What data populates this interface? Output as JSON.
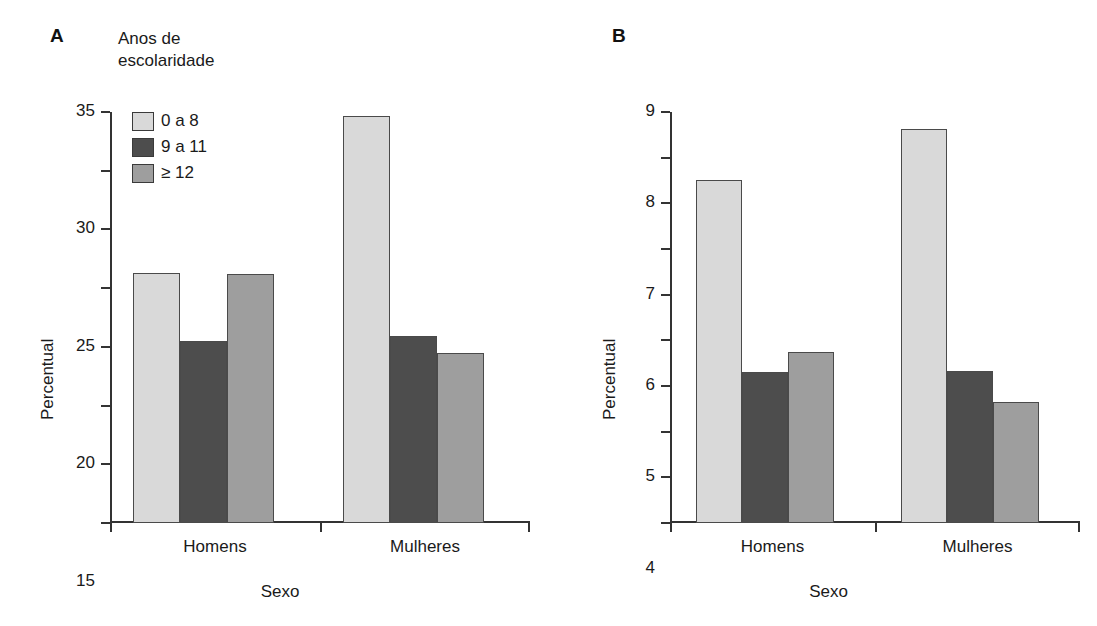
{
  "figure": {
    "panels": [
      {
        "letter": "A",
        "legend_title": "Anos de\nescolaridade",
        "ylabel": "Percentual",
        "xlabel": "Sexo"
      },
      {
        "letter": "B",
        "ylabel": "Percentual",
        "xlabel": "Sexo"
      }
    ]
  },
  "legend": {
    "items": [
      {
        "label": "0 a 8",
        "color": "#d9d9d9"
      },
      {
        "label": "9 a 11",
        "color": "#4d4d4d"
      },
      {
        "label": "≥ 12",
        "color": "#9e9e9e"
      }
    ]
  },
  "colors": {
    "series_0_a_8": "#d9d9d9",
    "series_9_a_11": "#4d4d4d",
    "series_ge_12": "#9e9e9e",
    "axis": "#333333",
    "text": "#1a1a1a",
    "background": "#ffffff"
  },
  "chart_data": [
    {
      "type": "bar",
      "panel": "A",
      "title": "",
      "xlabel": "Sexo",
      "ylabel": "Percentual",
      "categories": [
        "Homens",
        "Mulheres"
      ],
      "series": [
        {
          "name": "0 a 8",
          "values": [
            21.3,
            34.7
          ]
        },
        {
          "name": "9 a 11",
          "values": [
            15.5,
            15.9
          ]
        },
        {
          "name": "≥ 12",
          "values": [
            21.2,
            14.5
          ]
        }
      ],
      "ylim": [
        0,
        35
      ],
      "yticks": [
        0,
        5,
        10,
        15,
        20,
        25,
        30,
        35
      ],
      "ytick_labels": [
        "0",
        "5",
        "10",
        "15",
        "20",
        "25",
        "30",
        "35"
      ],
      "grid": false,
      "legend_position": "upper-left",
      "legend_title": "Anos de escolaridade"
    },
    {
      "type": "bar",
      "panel": "B",
      "title": "",
      "xlabel": "Sexo",
      "ylabel": "Percentual",
      "categories": [
        "Homens",
        "Mulheres"
      ],
      "series": [
        {
          "name": "0 a 8",
          "values": [
            7.52,
            8.62
          ]
        },
        {
          "name": "9 a 11",
          "values": [
            3.3,
            3.32
          ]
        },
        {
          "name": "≥ 12",
          "values": [
            3.75,
            2.65
          ]
        }
      ],
      "ylim": [
        0,
        9
      ],
      "yticks": [
        0,
        1,
        2,
        3,
        4,
        5,
        6,
        7,
        8,
        9
      ],
      "ytick_labels": [
        "0",
        "1",
        "2",
        "3",
        "4",
        "5",
        "6",
        "7",
        "8",
        "9"
      ],
      "grid": false,
      "legend_position": "none"
    }
  ]
}
